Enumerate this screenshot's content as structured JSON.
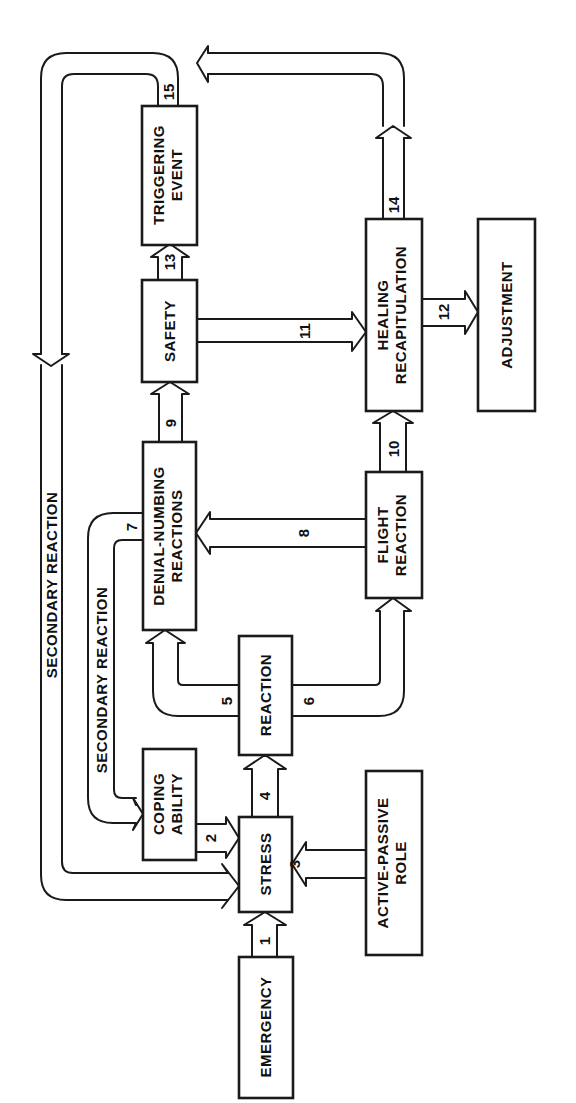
{
  "diagram": {
    "type": "flowchart",
    "orientation": "rotated-90-ccw",
    "nodes": {
      "emergency": {
        "label": "EMERGENCY"
      },
      "stress": {
        "label": "STRESS"
      },
      "active_passive": {
        "line1": "ACTIVE-PASSIVE",
        "line2": "ROLE"
      },
      "coping": {
        "line1": "COPING",
        "line2": "ABILITY"
      },
      "reaction": {
        "label": "REACTION"
      },
      "denial": {
        "line1": "DENIAL-NUMBING",
        "line2": "REACTIONS"
      },
      "flight": {
        "line1": "FLIGHT",
        "line2": "REACTION"
      },
      "safety": {
        "label": "SAFETY"
      },
      "healing": {
        "line1": "HEALING",
        "line2": "RECAPITULATION"
      },
      "adjustment": {
        "label": "ADJUSTMENT"
      },
      "triggering": {
        "line1": "TRIGGERING",
        "line2": "EVENT"
      }
    },
    "edges": [
      {
        "id": "1",
        "from": "EMERGENCY",
        "to": "STRESS"
      },
      {
        "id": "2",
        "from": "COPING ABILITY",
        "to": "STRESS"
      },
      {
        "id": "3",
        "from": "ACTIVE-PASSIVE ROLE",
        "to": "STRESS"
      },
      {
        "id": "4",
        "from": "STRESS",
        "to": "REACTION"
      },
      {
        "id": "5",
        "from": "REACTION",
        "to": "DENIAL-NUMBING REACTIONS"
      },
      {
        "id": "6",
        "from": "REACTION",
        "to": "FLIGHT REACTION"
      },
      {
        "id": "7",
        "from": "DENIAL-NUMBING REACTIONS",
        "to": "COPING ABILITY",
        "label": "SECONDARY REACTION"
      },
      {
        "id": "8",
        "from": "FLIGHT REACTION",
        "to": "DENIAL-NUMBING REACTIONS"
      },
      {
        "id": "9",
        "from": "DENIAL-NUMBING REACTIONS",
        "to": "SAFETY"
      },
      {
        "id": "10",
        "from": "FLIGHT REACTION",
        "to": "HEALING RECAPITULATION"
      },
      {
        "id": "11",
        "from": "SAFETY",
        "to": "HEALING RECAPITULATION"
      },
      {
        "id": "12",
        "from": "HEALING RECAPITULATION",
        "to": "ADJUSTMENT"
      },
      {
        "id": "13",
        "from": "SAFETY",
        "to": "TRIGGERING EVENT"
      },
      {
        "id": "14",
        "from": "HEALING RECAPITULATION",
        "to": "TRIGGERING EVENT (loop)"
      },
      {
        "id": "15",
        "from": "TRIGGERING EVENT",
        "to": "STRESS",
        "label": "SECONDARY REACTION"
      }
    ],
    "edge_labels": {
      "e1": "1",
      "e2": "2",
      "e3": "3",
      "e4": "4",
      "e5": "5",
      "e6": "6",
      "e7": "7",
      "e8": "8",
      "e9": "9",
      "e10": "10",
      "e11": "11",
      "e12": "12",
      "e13": "13",
      "e14": "14",
      "e15": "15"
    },
    "loop_labels": {
      "outer": "SECONDARY REACTION",
      "inner": "SECONDARY REACTION"
    },
    "colors": {
      "line": "#1a1a1a",
      "background": "#ffffff"
    }
  }
}
